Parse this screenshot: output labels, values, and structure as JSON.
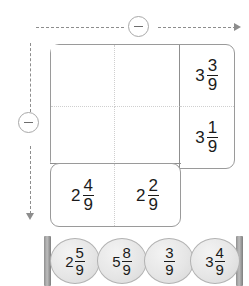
{
  "operators": {
    "top": {
      "icon": "minus-circle-icon",
      "symbol": "−"
    },
    "left": {
      "icon": "minus-circle-icon",
      "symbol": "−"
    }
  },
  "grid": {
    "rows": [
      {
        "cells": [
          {
            "state": "empty",
            "whole": "",
            "num": "",
            "den": ""
          },
          {
            "state": "empty",
            "whole": "",
            "num": "",
            "den": ""
          },
          {
            "state": "filled",
            "whole": "3",
            "num": "3",
            "den": "9"
          }
        ]
      },
      {
        "cells": [
          {
            "state": "empty",
            "whole": "",
            "num": "",
            "den": ""
          },
          {
            "state": "empty",
            "whole": "",
            "num": "",
            "den": ""
          },
          {
            "state": "filled",
            "whole": "3",
            "num": "1",
            "den": "9"
          }
        ]
      },
      {
        "cells": [
          {
            "state": "filled",
            "whole": "2",
            "num": "4",
            "den": "9"
          },
          {
            "state": "filled",
            "whole": "2",
            "num": "2",
            "den": "9"
          }
        ]
      }
    ]
  },
  "tray": {
    "tokens": [
      {
        "whole": "2",
        "num": "5",
        "den": "9"
      },
      {
        "whole": "5",
        "num": "8",
        "den": "9"
      },
      {
        "whole": "",
        "num": "3",
        "den": "9"
      },
      {
        "whole": "3",
        "num": "4",
        "den": "9"
      }
    ]
  }
}
